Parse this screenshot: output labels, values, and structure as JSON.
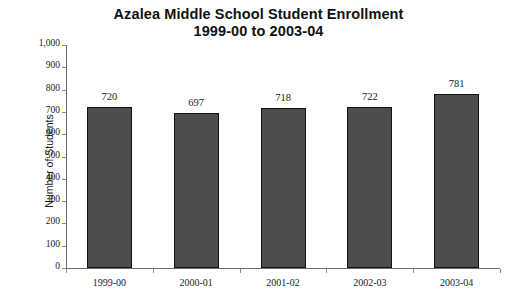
{
  "chart_data": {
    "type": "bar",
    "title": "Azalea Middle School Student Enrollment",
    "subtitle": "1999-00 to 2003-04",
    "title_lines": [
      "Azalea Middle School Student Enrollment",
      "1999-00 to 2003-04"
    ],
    "categories": [
      "1999-00",
      "2000-01",
      "2001-02",
      "2002-03",
      "2003-04"
    ],
    "values": [
      720,
      697,
      718,
      722,
      781
    ],
    "value_labels": [
      "720",
      "697",
      "718",
      "722",
      "781"
    ],
    "xlabel": "",
    "ylabel": "Number of Students",
    "ylim": [
      0,
      1000
    ],
    "ytick_step": 100,
    "ytick_labels": [
      "1,000",
      "900",
      "800",
      "700",
      "600",
      "500",
      "400",
      "300",
      "200",
      "100",
      "0"
    ],
    "ytick_values": [
      1000,
      900,
      800,
      700,
      600,
      500,
      400,
      300,
      200,
      100,
      0
    ],
    "grid": false,
    "legend": null,
    "series_name": "Student Enrollment",
    "bar_color": "#4d4d4d",
    "bar_edge_color": "#121212",
    "axis_color": "#6d6d6d",
    "background_color": "#ffffff",
    "text_color": "#1a1a1a"
  }
}
